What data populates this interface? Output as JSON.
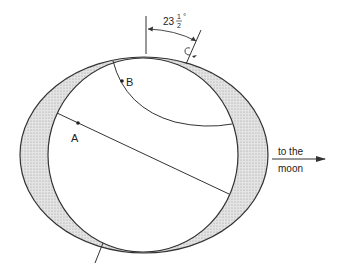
{
  "diagram": {
    "angle_label": "23½°",
    "angle_whole": "23",
    "angle_frac_num": "1",
    "angle_frac_den": "2",
    "angle_deg": "°",
    "point_a_label": "A",
    "point_b_label": "B",
    "direction_label_line1": "to the",
    "direction_label_line2": "moon"
  },
  "colors": {
    "stroke": "#333333",
    "bulge_fill": "#d9d9d9",
    "background": "#ffffff"
  }
}
